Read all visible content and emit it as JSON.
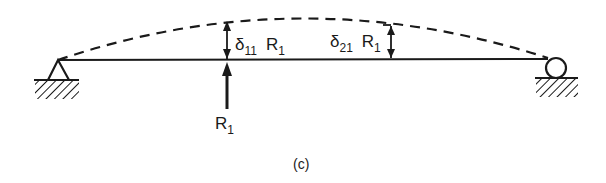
{
  "diagram": {
    "type": "simply-supported-beam-deflection",
    "caption": "(c)",
    "labels": {
      "delta11": {
        "symbol": "δ",
        "subscript": "11",
        "factor": "R",
        "factor_sub": "1"
      },
      "delta21": {
        "symbol": "δ",
        "subscript": "21",
        "factor": "R",
        "factor_sub": "1"
      },
      "reaction": {
        "symbol": "R",
        "subscript": "1"
      }
    },
    "supports": {
      "left": "pin",
      "right": "roller"
    },
    "colors": {
      "ink": "#1a1a1a",
      "background": "#ffffff"
    }
  }
}
